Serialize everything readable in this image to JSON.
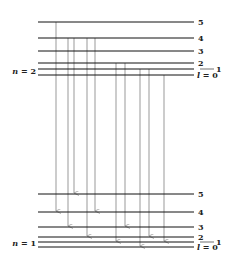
{
  "upper_group": {
    "label": "n = 2",
    "levels": [
      {
        "l": "5",
        "y": 22
      },
      {
        "l": "4",
        "y": 38
      },
      {
        "l": "3",
        "y": 51
      },
      {
        "l": "2",
        "y": 63
      },
      {
        "l": "1",
        "y": 69
      },
      {
        "l": "l = 0",
        "y": 75
      }
    ]
  },
  "lower_group": {
    "label": "n = 1",
    "levels": [
      {
        "l": "5",
        "y": 194
      },
      {
        "l": "4",
        "y": 212
      },
      {
        "l": "3",
        "y": 227
      },
      {
        "l": "2",
        "y": 237
      },
      {
        "l": "1",
        "y": 242
      },
      {
        "l": "l = 0",
        "y": 247
      }
    ]
  },
  "transitions": [
    {
      "x": 56,
      "y1": 22,
      "y2": 212
    },
    {
      "x": 68,
      "y1": 38,
      "y2": 227
    },
    {
      "x": 74,
      "y1": 38,
      "y2": 194
    },
    {
      "x": 87,
      "y1": 38,
      "y2": 237
    },
    {
      "x": 95,
      "y1": 38,
      "y2": 212
    },
    {
      "x": 116,
      "y1": 63,
      "y2": 242
    },
    {
      "x": 125,
      "y1": 63,
      "y2": 227
    },
    {
      "x": 140,
      "y1": 69,
      "y2": 247
    },
    {
      "x": 149,
      "y1": 69,
      "y2": 237
    },
    {
      "x": 164,
      "y1": 75,
      "y2": 242
    }
  ],
  "colors": {
    "level_line": "#111111",
    "arrow": "#999999"
  }
}
